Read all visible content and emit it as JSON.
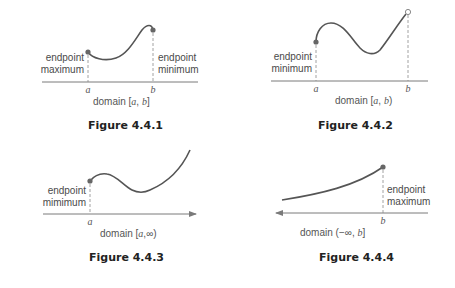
{
  "colors": {
    "curve": "#555555",
    "axis": "#7a7a7a",
    "dashed": "#8a8a8a",
    "dot": "#666666",
    "label": "#4a4a4a",
    "caption": "#222222"
  },
  "figures": [
    {
      "id": "4.4.1",
      "caption": "Figure 4.4.1",
      "domain_prefix": "domain [",
      "domain_a": "a",
      "domain_sep": ", ",
      "domain_b": "b",
      "domain_suffix": "]",
      "tick_a": "a",
      "tick_b": "b",
      "left_label_line1": "endpoint",
      "left_label_line2": "maximum",
      "right_label_line1": "endpoint",
      "right_label_line2": "minimum",
      "endpoint_a": "closed",
      "endpoint_b": "closed"
    },
    {
      "id": "4.4.2",
      "caption": "Figure 4.4.2",
      "domain_prefix": "domain [",
      "domain_a": "a",
      "domain_sep": ", ",
      "domain_b": "b",
      "domain_suffix": ")",
      "tick_a": "a",
      "tick_b": "b",
      "left_label_line1": "endpoint",
      "left_label_line2": "minimum",
      "endpoint_a": "closed",
      "endpoint_b": "open"
    },
    {
      "id": "4.4.3",
      "caption": "Figure 4.4.3",
      "domain_prefix": "domain [",
      "domain_a": "a",
      "domain_sep": ",",
      "domain_b": "∞",
      "domain_suffix": ")",
      "tick_a": "a",
      "left_label_line1": "endpoint",
      "left_label_line2": "mimimum",
      "endpoint_a": "closed",
      "axis_arrow": "right"
    },
    {
      "id": "4.4.4",
      "caption": "Figure 4.4.4",
      "domain_prefix": "domain (",
      "domain_a": "−∞",
      "domain_sep": ", ",
      "domain_b": "b",
      "domain_suffix": "]",
      "tick_b": "b",
      "right_label_line1": "endpoint",
      "right_label_line2": "maximum",
      "endpoint_b": "closed",
      "axis_arrow": "left"
    }
  ]
}
